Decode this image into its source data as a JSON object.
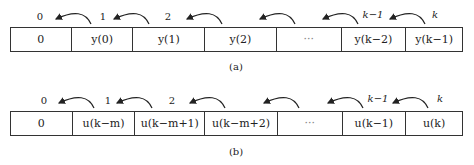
{
  "diagram_a": {
    "caption": "(a)",
    "cells": [
      "0",
      "y(0)",
      "y(1)",
      "y(2)",
      "···",
      "y(k−2)",
      "y(k−1)"
    ],
    "indices": [
      "0",
      "1",
      "2",
      "k−1",
      "k"
    ]
  },
  "diagram_b": {
    "caption": "(b)",
    "cells": [
      "0",
      "u(k−m)",
      "u(k−m+1)",
      "u(k−m+2)",
      "···",
      "u(k−1)",
      "u(k)"
    ],
    "indices": [
      "0",
      "1",
      "2",
      "k−1",
      "k"
    ]
  }
}
